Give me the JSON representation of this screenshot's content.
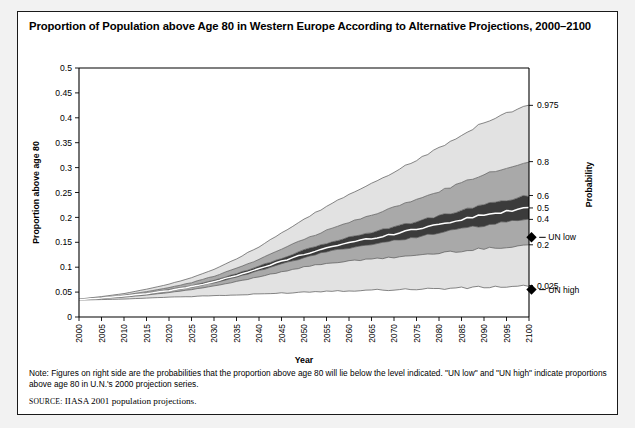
{
  "figure": {
    "title": "Proportion of Population above Age 80 in Western Europe According to Alternative Projections, 2000–2100",
    "note_label": "Note:",
    "note_text": "Figures on right side are the probabilities that the proportion above age 80 will lie below the level indicated. \"UN low\" and \"UN high\" indicate proportions above age 80 in U.N.'s 2000 projection series.",
    "source_label": "SOURCE:",
    "source_text": "IIASA 2001 population projections."
  },
  "colors": {
    "band_outer": "#e2e2e2",
    "band_mid": "#a9a9a9",
    "band_inner": "#3b3b3b",
    "median_line": "#ffffff",
    "outline": "#555555",
    "axis": "#000000",
    "frame": "#1a1a1a",
    "page_bg": "#f2f2f2"
  },
  "chart_data": {
    "type": "area",
    "title": "Proportion of Population above Age 80 in Western Europe According to Alternative Projections, 2000–2100",
    "xlabel": "Year",
    "ylabel": "Proportion above age 80",
    "y2label": "Probability",
    "xlim": [
      2000,
      2100
    ],
    "ylim": [
      0,
      0.5
    ],
    "grid": false,
    "legend_position": "right-axis",
    "x": [
      2000,
      2005,
      2010,
      2015,
      2020,
      2025,
      2030,
      2035,
      2040,
      2045,
      2050,
      2055,
      2060,
      2065,
      2070,
      2075,
      2080,
      2085,
      2090,
      2095,
      2100
    ],
    "xtick_labels": [
      "2000",
      "2005",
      "2010",
      "2015",
      "2020",
      "2025",
      "2030",
      "2035",
      "2040",
      "2045",
      "2050",
      "2055",
      "2060",
      "2065",
      "2070",
      "2075",
      "2080",
      "2085",
      "2090",
      "2095",
      "2100"
    ],
    "ytick_labels": [
      "0",
      "0.05",
      "0.1",
      "0.15",
      "0.2",
      "0.25",
      "0.3",
      "0.35",
      "0.4",
      "0.45",
      "0.5"
    ],
    "ytick_values": [
      0,
      0.05,
      0.1,
      0.15,
      0.2,
      0.25,
      0.3,
      0.35,
      0.4,
      0.45,
      0.5
    ],
    "probability_ticks": [
      {
        "label": "0.975",
        "value": 0.425
      },
      {
        "label": "0.8",
        "value": 0.312
      },
      {
        "label": "0.6",
        "value": 0.244
      },
      {
        "label": "0.5",
        "value": 0.219
      },
      {
        "label": "0.4",
        "value": 0.196
      },
      {
        "label": "0.2",
        "value": 0.145
      },
      {
        "label": "0.025",
        "value": 0.063
      }
    ],
    "markers": [
      {
        "label": "UN low",
        "value": 0.16,
        "symbol": "diamond"
      },
      {
        "label": "UN high",
        "value": 0.055,
        "symbol": "diamond"
      }
    ],
    "series": [
      {
        "name": "0.025 quantile",
        "probability": 0.025,
        "values": [
          0.034,
          0.035,
          0.036,
          0.038,
          0.04,
          0.041,
          0.043,
          0.044,
          0.046,
          0.048,
          0.05,
          0.052,
          0.053,
          0.054,
          0.055,
          0.056,
          0.057,
          0.058,
          0.06,
          0.061,
          0.063
        ]
      },
      {
        "name": "0.2 quantile",
        "probability": 0.2,
        "values": [
          0.035,
          0.037,
          0.04,
          0.044,
          0.049,
          0.055,
          0.062,
          0.071,
          0.081,
          0.091,
          0.1,
          0.108,
          0.112,
          0.116,
          0.12,
          0.124,
          0.128,
          0.133,
          0.137,
          0.141,
          0.145
        ]
      },
      {
        "name": "0.4 quantile",
        "probability": 0.4,
        "values": [
          0.035,
          0.038,
          0.041,
          0.046,
          0.052,
          0.06,
          0.069,
          0.08,
          0.093,
          0.106,
          0.119,
          0.131,
          0.139,
          0.146,
          0.153,
          0.161,
          0.169,
          0.177,
          0.184,
          0.19,
          0.196
        ]
      },
      {
        "name": "0.5 median",
        "probability": 0.5,
        "values": [
          0.035,
          0.038,
          0.042,
          0.047,
          0.053,
          0.061,
          0.071,
          0.083,
          0.097,
          0.112,
          0.126,
          0.139,
          0.149,
          0.158,
          0.167,
          0.177,
          0.186,
          0.196,
          0.205,
          0.212,
          0.219
        ]
      },
      {
        "name": "0.6 quantile",
        "probability": 0.6,
        "values": [
          0.035,
          0.038,
          0.042,
          0.048,
          0.055,
          0.063,
          0.074,
          0.087,
          0.102,
          0.118,
          0.134,
          0.148,
          0.16,
          0.17,
          0.181,
          0.192,
          0.203,
          0.214,
          0.225,
          0.235,
          0.244
        ]
      },
      {
        "name": "0.8 quantile",
        "probability": 0.8,
        "values": [
          0.036,
          0.039,
          0.044,
          0.051,
          0.059,
          0.069,
          0.082,
          0.098,
          0.116,
          0.136,
          0.156,
          0.174,
          0.19,
          0.205,
          0.22,
          0.236,
          0.252,
          0.269,
          0.286,
          0.3,
          0.312
        ]
      },
      {
        "name": "0.975 quantile",
        "probability": 0.975,
        "values": [
          0.036,
          0.041,
          0.047,
          0.056,
          0.066,
          0.079,
          0.096,
          0.117,
          0.141,
          0.168,
          0.196,
          0.222,
          0.246,
          0.269,
          0.291,
          0.315,
          0.34,
          0.366,
          0.391,
          0.41,
          0.425
        ]
      }
    ],
    "bands": [
      {
        "name": "0.025–0.2 outer lower",
        "lower": "0.025 quantile",
        "upper": "0.2 quantile",
        "shade": "#e2e2e2"
      },
      {
        "name": "0.2–0.4 middle lower",
        "lower": "0.2 quantile",
        "upper": "0.4 quantile",
        "shade": "#a9a9a9"
      },
      {
        "name": "0.4–0.6 inner",
        "lower": "0.4 quantile",
        "upper": "0.6 quantile",
        "shade": "#3b3b3b"
      },
      {
        "name": "0.6–0.8 middle upper",
        "lower": "0.6 quantile",
        "upper": "0.8 quantile",
        "shade": "#a9a9a9"
      },
      {
        "name": "0.8–0.975 outer upper",
        "lower": "0.8 quantile",
        "upper": "0.975 quantile",
        "shade": "#e2e2e2"
      }
    ]
  }
}
